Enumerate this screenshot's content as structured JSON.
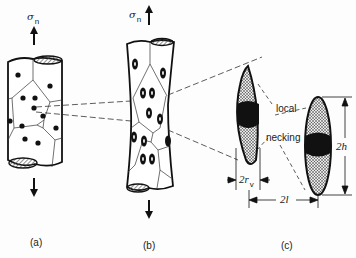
{
  "figure": {
    "panels": [
      {
        "id": "a",
        "label": "(a)",
        "stress_symbol": "σ",
        "stress_subscript": "n",
        "description": "cylindrical specimen with grains and spherical inclusions/voids under tensile stress"
      },
      {
        "id": "b",
        "label": "(b)",
        "stress_symbol": "σ",
        "stress_subscript": "n",
        "description": "elongated voids after straining, specimen begins to neck"
      },
      {
        "id": "c",
        "label": "(c)",
        "description": "enlarged elongated voids with local necking between them"
      }
    ],
    "annotations": {
      "local": "local",
      "necking": "necking",
      "dim_height": "2h",
      "dim_radius_prefix": "2r",
      "dim_radius_subscript": "v",
      "dim_spacing": "2l"
    },
    "colors": {
      "ink": "#111111",
      "hatch": "#555555",
      "background": "#fdfdfd"
    }
  }
}
